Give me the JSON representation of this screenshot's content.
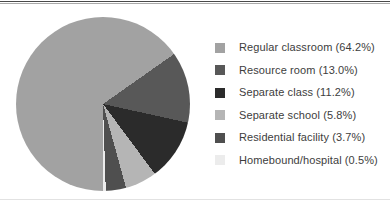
{
  "frame": {
    "background": "#ffffff",
    "top_rule_dark_color": "#4a4a4a",
    "top_rule_light_color": "#aaaaaa",
    "bottom_rule_color": "#e2e2e2"
  },
  "chart_data": {
    "type": "pie",
    "title": "",
    "start_angle_deg": 180,
    "direction": "clockwise",
    "legend_position": "right",
    "categories": [
      "Regular classroom",
      "Resource room",
      "Separate class",
      "Separate school",
      "Residential facility",
      "Homebound/hospital"
    ],
    "values": [
      64.2,
      13.0,
      11.2,
      5.8,
      3.7,
      0.5
    ],
    "slices": [
      {
        "label": "Regular classroom",
        "value_pct": 64.2,
        "color": "#a2a2a2",
        "legend_text": "Regular classroom (64.2%)"
      },
      {
        "label": "Resource room",
        "value_pct": 13.0,
        "color": "#585858",
        "legend_text": "Resource room (13.0%)"
      },
      {
        "label": "Separate class",
        "value_pct": 11.2,
        "color": "#2b2b2b",
        "legend_text": "Separate class (11.2%)"
      },
      {
        "label": "Separate school",
        "value_pct": 5.8,
        "color": "#b5b5b5",
        "legend_text": "Separate school (5.8%)"
      },
      {
        "label": "Residential facility",
        "value_pct": 3.7,
        "color": "#4f4f4f",
        "legend_text": "Residential facility (3.7%)"
      },
      {
        "label": "Homebound/hospital",
        "value_pct": 0.5,
        "color": "#ececec",
        "legend_text": "Homebound/hospital (0.5%)"
      }
    ]
  }
}
